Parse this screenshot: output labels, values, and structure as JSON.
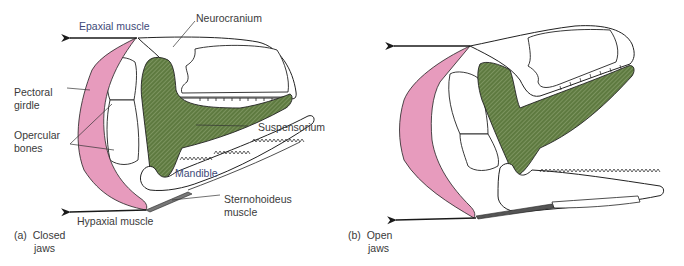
{
  "figure": {
    "colors": {
      "muscle_pink": "#e79bbd",
      "suspensorium_green": "#5e7a40",
      "outline": "#2a2a2a",
      "label_text": "#3a3a3a",
      "blue_label_text": "#3e4a78"
    },
    "panel_a": {
      "caption_letter": "(a)",
      "caption_line1": "Closed",
      "caption_line2": "jaws",
      "labels": {
        "epaxial": "Epaxial muscle",
        "neurocranium": "Neurocranium",
        "pectoral_line1": "Pectoral",
        "pectoral_line2": "girdle",
        "opercular_line1": "Opercular",
        "opercular_line2": "bones",
        "suspensorium": "Suspensorium",
        "mandible": "Mandible",
        "sternohyoideus_line1": "Sternohoideus",
        "sternohyoideus_line2": "muscle",
        "hypaxial": "Hypaxial muscle"
      }
    },
    "panel_b": {
      "caption_letter": "(b)",
      "caption_line1": "Open",
      "caption_line2": "jaws"
    }
  }
}
